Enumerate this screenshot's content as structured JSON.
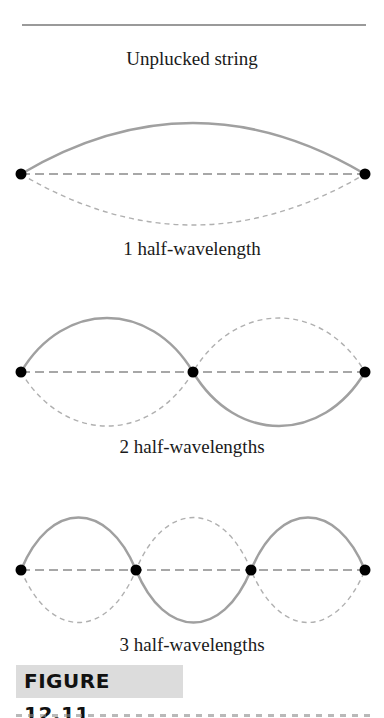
{
  "header": {
    "title": "Unplucked string"
  },
  "diagrams": [
    {
      "caption": "1 half-wavelength",
      "half_wavelengths": 1
    },
    {
      "caption": "2 half-wavelengths",
      "half_wavelengths": 2
    },
    {
      "caption": "3 half-wavelengths",
      "half_wavelengths": 3
    }
  ],
  "figure": {
    "label": "FIGURE 12.11"
  },
  "colors": {
    "solid_wave": "#a0a0a0",
    "dashed_wave": "#b0b0b0",
    "rest_line": "#8a8a8a",
    "node": "#000000",
    "label_bg": "#dcdcdc"
  }
}
